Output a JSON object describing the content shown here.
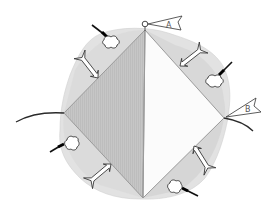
{
  "diagram": {
    "type": "schematic",
    "colors": {
      "background": "#ffffff",
      "blob_fill": "#e2e2e2",
      "blob_inner": "#d4d4d4",
      "left_triangle_fill": "#c4c4c4",
      "right_triangle_fill": "#fbfbfb",
      "edge_stroke": "#9a9a9a",
      "line_stroke": "#2a2a2a",
      "arrow_fill": "#ffffff",
      "arrow_stroke": "#333333",
      "cloud_fill": "#ffffff",
      "cloud_stroke": "#222222",
      "tube_color": "#111111"
    },
    "flags": [
      {
        "id": "flag-a",
        "label": "A",
        "position": "top vertex"
      },
      {
        "id": "flag-b",
        "label": "B",
        "position": "right vertex"
      }
    ],
    "vertices": {
      "top": [
        145,
        30
      ],
      "right": [
        224,
        118
      ],
      "bottom": [
        143,
        198
      ],
      "left": [
        64,
        113
      ]
    },
    "arrows_count": 4,
    "clouds_count": 4
  }
}
